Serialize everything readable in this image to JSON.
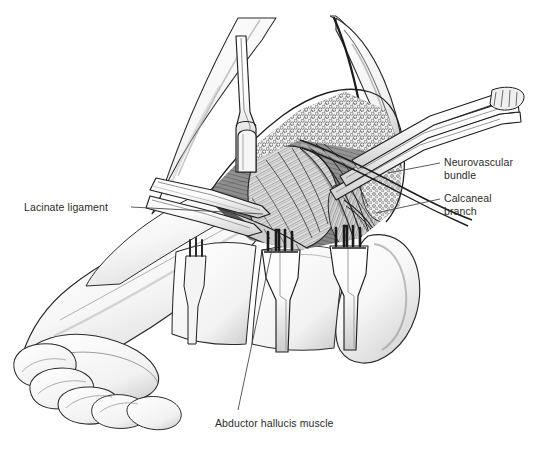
{
  "figure": {
    "kind": "medical-surgical-illustration",
    "background_color": "#ffffff",
    "ink_color": "#1d1d1d",
    "label_color": "#2b2b2b",
    "width": 539,
    "height": 453
  },
  "labels": {
    "neurovascular_bundle": "Neurovascular\nbundle",
    "calcaneal_branch": "Calcaneal\nbranch",
    "lacinate_ligament": "Lacinate ligament",
    "abductor_hallucis": "Abductor hallucis muscle"
  },
  "leaders": {
    "neurovascular_bundle": {
      "x1": 440,
      "y1": 163,
      "x2": 388,
      "y2": 173
    },
    "calcaneal_branch": {
      "x1": 440,
      "y1": 199,
      "x2": 376,
      "y2": 213
    },
    "lacinate_ligament": {
      "x1": 131,
      "y1": 207,
      "x2": 263,
      "y2": 214
    },
    "abductor_hallucis": {
      "x1": 238,
      "y1": 410,
      "x2": 272,
      "y2": 249
    }
  },
  "scene": {
    "foot": "medial plantar view of foot with toes at lower left and heel at right",
    "instruments": [
      "vertical-blade-retractor",
      "flat-blade-retractor",
      "upper-ribbon-retractor",
      "rake-retractor-left",
      "rake-retractor-right"
    ],
    "structures": [
      "skin-flap",
      "subcutaneous-fat",
      "abductor-hallucis-muscle-belly",
      "neurovascular-bundle-strands",
      "calcaneal-branch-nerve"
    ]
  }
}
